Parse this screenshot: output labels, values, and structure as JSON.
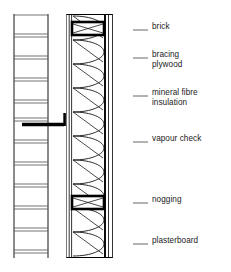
{
  "diagram": {
    "type": "architectural-section",
    "background_color": "#ffffff",
    "line_color": "#000000",
    "leader_color": "#555555",
    "text_color": "#1a1a1a"
  },
  "labels": [
    {
      "id": "brick",
      "text": "brick",
      "x": 152,
      "y": 26,
      "leader_y": 30,
      "leader_x1": 133,
      "leader_x2": 148
    },
    {
      "id": "plywood",
      "text": "bracing\nplywood",
      "x": 152,
      "y": 54,
      "leader_y": 58,
      "leader_x1": 133,
      "leader_x2": 148
    },
    {
      "id": "insulation",
      "text": "mineral fibre\ninsulation",
      "x": 152,
      "y": 92,
      "leader_y": 96,
      "leader_x1": 133,
      "leader_x2": 148
    },
    {
      "id": "vapour",
      "text": "vapour check",
      "x": 152,
      "y": 138,
      "leader_y": 142,
      "leader_x1": 133,
      "leader_x2": 148
    },
    {
      "id": "nogging",
      "text": "nogging",
      "x": 152,
      "y": 199,
      "leader_y": 203,
      "leader_x1": 133,
      "leader_x2": 148
    },
    {
      "id": "plasterboard",
      "text": "plasterboard",
      "x": 152,
      "y": 240,
      "leader_y": 244,
      "leader_x1": 133,
      "leader_x2": 148
    }
  ],
  "layers": {
    "brick_outer_leaf": {
      "x": 14,
      "width": 34,
      "label": "brick"
    },
    "cavity": {
      "x": 48,
      "width": 18,
      "label": "cavity"
    },
    "breather_membrane": {
      "x": 66,
      "width": 2,
      "label": "breather membrane"
    },
    "bracing_plywood": {
      "x": 68,
      "width": 4,
      "label": "bracing plywood"
    },
    "stud_insulation": {
      "x": 72,
      "width": 32,
      "label": "mineral fibre insulation"
    },
    "vapour_check": {
      "x": 104,
      "width": 2,
      "label": "vapour check"
    },
    "plasterboard": {
      "x": 106,
      "width": 6,
      "label": "plasterboard"
    }
  },
  "components": {
    "brick_course_count": 12,
    "brick_course_top": 16,
    "brick_course_height": 20,
    "wall_tie": {
      "y": 122,
      "x1": 22,
      "x2": 68
    },
    "noggings": [
      {
        "y": 24,
        "height": 14
      },
      {
        "y": 196,
        "height": 14
      }
    ],
    "insulation_top": 16,
    "insulation_bottom": 256
  }
}
